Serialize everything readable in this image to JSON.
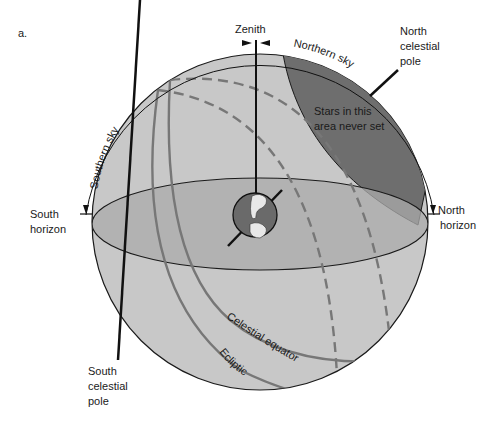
{
  "figure": {
    "panel_label": "a.",
    "labels": {
      "zenith": "Zenith",
      "northern_sky": "Northern sky",
      "southern_sky": "Southern sky",
      "north_celestial_pole": [
        "North",
        "celestial",
        "pole"
      ],
      "south_celestial_pole": [
        "South",
        "celestial",
        "pole"
      ],
      "south_horizon": [
        "South",
        "horizon"
      ],
      "north_horizon": [
        "North",
        "horizon"
      ],
      "circumpolar_note": [
        "Stars in this",
        "area never set"
      ],
      "celestial_equator": "Celestial equator",
      "ecliptic": "Ecliptic"
    },
    "colors": {
      "sphere": "#c8c8c8",
      "horizon_plane": "#ababab",
      "circumpolar_region": "#6e6e6e",
      "earth": "#6a6a6a",
      "great_circle": "#777777",
      "outline": "#1a1a1a"
    }
  }
}
